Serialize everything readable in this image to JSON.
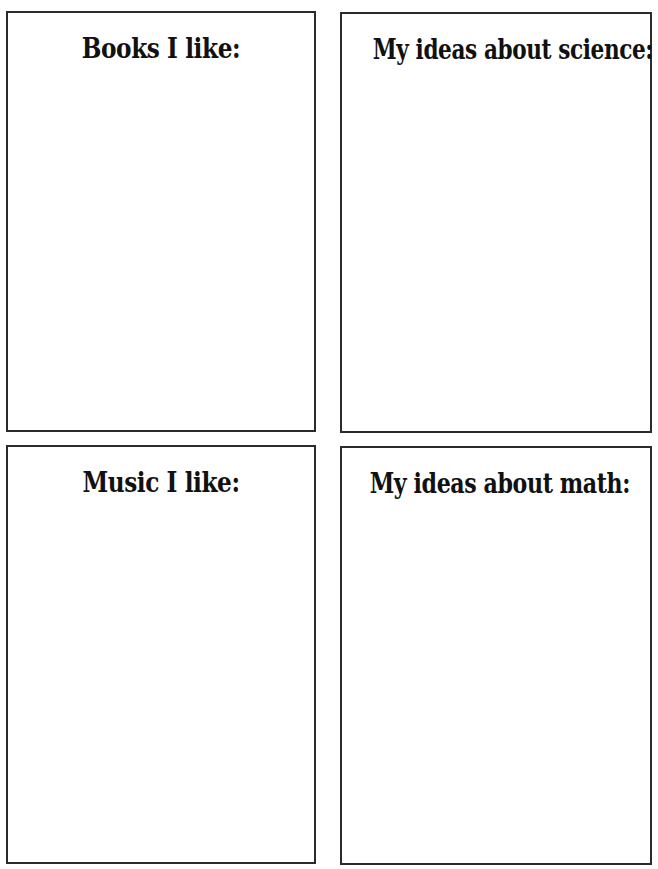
{
  "worksheet": {
    "panels": [
      {
        "id": "books",
        "heading": "Books I like:"
      },
      {
        "id": "science",
        "heading": "My ideas about science:"
      },
      {
        "id": "music",
        "heading": "Music I like:"
      },
      {
        "id": "math",
        "heading": "My ideas about math:"
      }
    ],
    "colors": {
      "border": "#2b2b2b",
      "text": "#111111",
      "background": "#ffffff"
    }
  }
}
